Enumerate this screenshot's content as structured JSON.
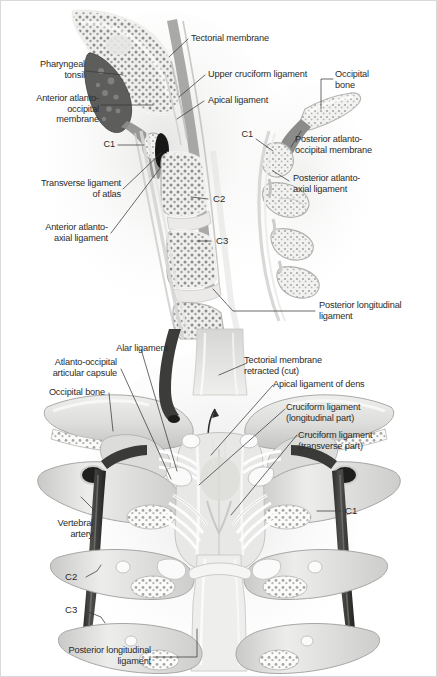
{
  "figure": {
    "background_color": "#ffffff",
    "border_color": "#d9d9d9",
    "label_color": "#2b2b2b",
    "leader_color": "#3a3a3a"
  },
  "panels": [
    {
      "id": "midsagittal-section",
      "view": "Midsagittal section, craniovertebral junction",
      "labels": [
        {
          "key": "pharyngeal_tonsil",
          "text": "Pharyngeal\ntonsil",
          "align": "right"
        },
        {
          "key": "anterior_atlanto_occipital",
          "text": "Anterior atlanto-\noccipital\nmembrane",
          "align": "right"
        },
        {
          "key": "c1_left",
          "text": "C1",
          "align": "right"
        },
        {
          "key": "transverse_ligament_of_atlas",
          "text": "Transverse ligament\nof atlas",
          "align": "right"
        },
        {
          "key": "anterior_atlanto_axial",
          "text": "Anterior atlanto-\naxial ligament",
          "align": "right"
        },
        {
          "key": "tectorial_membrane",
          "text": "Tectorial membrane",
          "align": "left"
        },
        {
          "key": "upper_cruciform_ligament",
          "text": "Upper cruciform ligament",
          "align": "left"
        },
        {
          "key": "apical_ligament",
          "text": "Apical ligament",
          "align": "left"
        },
        {
          "key": "occipital_bone_top",
          "text": "Occipital\nbone",
          "align": "left"
        },
        {
          "key": "c1_right",
          "text": "C1",
          "align": "right"
        },
        {
          "key": "posterior_atlanto_occipital",
          "text": "Posterior atlanto-\noccipital membrane",
          "align": "left"
        },
        {
          "key": "posterior_atlanto_axial",
          "text": "Posterior atlanto-\naxial ligament",
          "align": "left"
        },
        {
          "key": "c2_level",
          "text": "C2",
          "align": "left"
        },
        {
          "key": "c3_level",
          "text": "C3",
          "align": "left"
        },
        {
          "key": "posterior_longitudinal_top",
          "text": "Posterior longitudinal\nligament",
          "align": "left"
        }
      ]
    },
    {
      "id": "posterior-view-dissection",
      "view": "Posterior view, tectorial membrane retracted",
      "labels": [
        {
          "key": "alar_ligament",
          "text": "Alar ligament",
          "align": "center"
        },
        {
          "key": "atlanto_occipital_capsule",
          "text": "Atlanto-occipital\narticular capsule",
          "align": "right"
        },
        {
          "key": "occipital_bone_bottom",
          "text": "Occipital bone",
          "align": "right"
        },
        {
          "key": "tectorial_membrane_retracted",
          "text": "Tectorial membrane\nretracted (cut)",
          "align": "left"
        },
        {
          "key": "apical_ligament_of_dens",
          "text": "Apical ligament of dens",
          "align": "left"
        },
        {
          "key": "cruciform_longitudinal",
          "text": "Cruciform ligament\n(longitudinal part)",
          "align": "left"
        },
        {
          "key": "cruciform_transverse",
          "text": "Cruciform ligament\n(transverse part)",
          "align": "left"
        },
        {
          "key": "c1_right_bottom",
          "text": "C1",
          "align": "left"
        },
        {
          "key": "vertebral_artery",
          "text": "Vertebral\nartery",
          "align": "right"
        },
        {
          "key": "c2_bottom",
          "text": "C2",
          "align": "right"
        },
        {
          "key": "c3_bottom",
          "text": "C3",
          "align": "right"
        },
        {
          "key": "posterior_longitudinal_bottom",
          "text": "Posterior longitudinal\nligament",
          "align": "right"
        }
      ]
    }
  ]
}
